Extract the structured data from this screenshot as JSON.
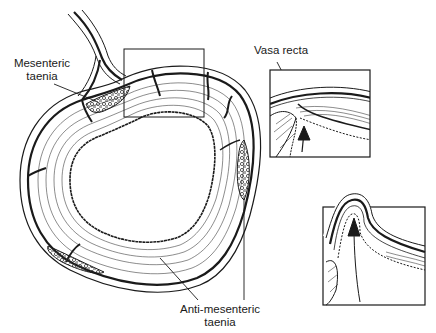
{
  "figure": {
    "type": "anatomical-diagram",
    "colors": {
      "ink": "#1a1a1a",
      "background": "#ffffff",
      "stipple": "#555555"
    }
  },
  "labels": {
    "mesenteric_taenia": {
      "line1": "Mesenteric",
      "line2": "taenia"
    },
    "vasa_recta": {
      "line1": "Vasa recta"
    },
    "anti_mesenteric_taenia": {
      "line1": "Anti-mesenteric",
      "line2": "taenia"
    }
  },
  "panels": [
    {
      "id": "main-cross-section",
      "description": "Ring-shaped colon wall with muscle layers and taeniae"
    },
    {
      "id": "inset-1",
      "description": "Vasa recta penetrating muscular wall, arrow showing early herniation"
    },
    {
      "id": "inset-2",
      "description": "Mucosa herniated through wall forming diverticulum, arrow pointing up"
    }
  ]
}
